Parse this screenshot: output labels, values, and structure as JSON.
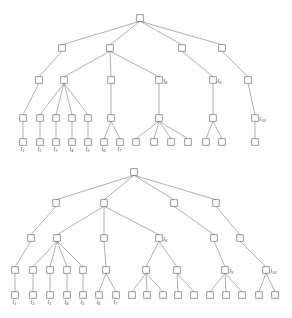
{
  "figure": {
    "type": "tree-diagram-pair",
    "width": 292,
    "height": 318,
    "background_color": "#ffffff",
    "node_fill": "#ffffff",
    "node_stroke": "#6e6e6e",
    "edge_stroke": "#7a7a7a",
    "label_color": "#3a3a3a",
    "node_size": 6.5
  },
  "trees": [
    {
      "name": "upper-tree",
      "id": "tree-top",
      "root": {
        "x": 140,
        "y": 18
      },
      "levels_y": [
        18,
        48,
        80,
        120,
        142
      ],
      "nodes": [
        {
          "id": "t0",
          "x": 140,
          "y": 18,
          "level": 0,
          "label": ""
        },
        {
          "id": "t1",
          "x": 62,
          "y": 48,
          "level": 1,
          "label": ""
        },
        {
          "id": "t2",
          "x": 110,
          "y": 48,
          "level": 1,
          "label": ""
        },
        {
          "id": "t3",
          "x": 182,
          "y": 48,
          "level": 1,
          "label": ""
        },
        {
          "id": "t4",
          "x": 222,
          "y": 48,
          "level": 1,
          "label": ""
        },
        {
          "id": "t5",
          "x": 39,
          "y": 80,
          "level": 2,
          "label": ""
        },
        {
          "id": "t6",
          "x": 64,
          "y": 80,
          "level": 2,
          "label": ""
        },
        {
          "id": "t7",
          "x": 111,
          "y": 80,
          "level": 2,
          "label": ""
        },
        {
          "id": "t8",
          "x": 159,
          "y": 80,
          "level": 2,
          "label": "l8"
        },
        {
          "id": "t9",
          "x": 213,
          "y": 80,
          "level": 2,
          "label": "l9"
        },
        {
          "id": "t10",
          "x": 248,
          "y": 80,
          "level": 2,
          "label": ""
        },
        {
          "id": "t11",
          "x": 23,
          "y": 118,
          "level": 3,
          "label": ""
        },
        {
          "id": "t12",
          "x": 40,
          "y": 118,
          "level": 3,
          "label": ""
        },
        {
          "id": "t13",
          "x": 56,
          "y": 118,
          "level": 3,
          "label": ""
        },
        {
          "id": "t14",
          "x": 72,
          "y": 118,
          "level": 3,
          "label": ""
        },
        {
          "id": "t15",
          "x": 88,
          "y": 118,
          "level": 3,
          "label": ""
        },
        {
          "id": "t16",
          "x": 111,
          "y": 118,
          "level": 3,
          "label": ""
        },
        {
          "id": "t17",
          "x": 159,
          "y": 118,
          "level": 3,
          "label": ""
        },
        {
          "id": "t18",
          "x": 213,
          "y": 118,
          "level": 3,
          "label": ""
        },
        {
          "id": "t19",
          "x": 255,
          "y": 118,
          "level": 3,
          "label": "l10"
        },
        {
          "id": "t20",
          "x": 23,
          "y": 142,
          "level": 4,
          "label": "l1"
        },
        {
          "id": "t21",
          "x": 40,
          "y": 142,
          "level": 4,
          "label": "l2"
        },
        {
          "id": "t22",
          "x": 56,
          "y": 142,
          "level": 4,
          "label": "l3"
        },
        {
          "id": "t23",
          "x": 72,
          "y": 142,
          "level": 4,
          "label": "l4"
        },
        {
          "id": "t24",
          "x": 88,
          "y": 142,
          "level": 4,
          "label": "l5"
        },
        {
          "id": "t25",
          "x": 104,
          "y": 142,
          "level": 4,
          "label": "l6"
        },
        {
          "id": "t26",
          "x": 120,
          "y": 142,
          "level": 4,
          "label": "l7"
        },
        {
          "id": "t27",
          "x": 136,
          "y": 142,
          "level": 4,
          "label": ""
        },
        {
          "id": "t28",
          "x": 154,
          "y": 142,
          "level": 4,
          "label": ""
        },
        {
          "id": "t29",
          "x": 171,
          "y": 142,
          "level": 4,
          "label": ""
        },
        {
          "id": "t30",
          "x": 188,
          "y": 142,
          "level": 4,
          "label": ""
        },
        {
          "id": "t31",
          "x": 206,
          "y": 142,
          "level": 4,
          "label": ""
        },
        {
          "id": "t32",
          "x": 222,
          "y": 142,
          "level": 4,
          "label": ""
        },
        {
          "id": "t33",
          "x": 255,
          "y": 142,
          "level": 4,
          "label": ""
        }
      ],
      "edges": [
        [
          "t0",
          "t1"
        ],
        [
          "t0",
          "t2"
        ],
        [
          "t0",
          "t3"
        ],
        [
          "t0",
          "t4"
        ],
        [
          "t1",
          "t5"
        ],
        [
          "t2",
          "t6"
        ],
        [
          "t2",
          "t7"
        ],
        [
          "t2",
          "t8"
        ],
        [
          "t3",
          "t9"
        ],
        [
          "t4",
          "t10"
        ],
        [
          "t5",
          "t11"
        ],
        [
          "t6",
          "t12"
        ],
        [
          "t6",
          "t13"
        ],
        [
          "t6",
          "t14"
        ],
        [
          "t6",
          "t15"
        ],
        [
          "t7",
          "t16"
        ],
        [
          "t8",
          "t17"
        ],
        [
          "t9",
          "t18"
        ],
        [
          "t10",
          "t19"
        ],
        [
          "t11",
          "t20"
        ],
        [
          "t12",
          "t21"
        ],
        [
          "t13",
          "t22"
        ],
        [
          "t14",
          "t23"
        ],
        [
          "t15",
          "t24"
        ],
        [
          "t16",
          "t25"
        ],
        [
          "t16",
          "t26"
        ],
        [
          "t17",
          "t27"
        ],
        [
          "t17",
          "t28"
        ],
        [
          "t17",
          "t29"
        ],
        [
          "t17",
          "t30"
        ],
        [
          "t18",
          "t31"
        ],
        [
          "t18",
          "t32"
        ],
        [
          "t19",
          "t33"
        ]
      ]
    },
    {
      "name": "lower-tree",
      "id": "tree-bottom",
      "root": {
        "x": 134,
        "y": 172
      },
      "levels_y": [
        172,
        203,
        238,
        270,
        295
      ],
      "nodes": [
        {
          "id": "b0",
          "x": 134,
          "y": 172,
          "level": 0,
          "label": ""
        },
        {
          "id": "b1",
          "x": 56,
          "y": 203,
          "level": 1,
          "label": ""
        },
        {
          "id": "b2",
          "x": 104,
          "y": 203,
          "level": 1,
          "label": ""
        },
        {
          "id": "b3",
          "x": 174,
          "y": 203,
          "level": 1,
          "label": ""
        },
        {
          "id": "b4",
          "x": 216,
          "y": 203,
          "level": 1,
          "label": ""
        },
        {
          "id": "b5",
          "x": 31,
          "y": 238,
          "level": 2,
          "label": ""
        },
        {
          "id": "b6",
          "x": 57,
          "y": 238,
          "level": 2,
          "label": ""
        },
        {
          "id": "b7",
          "x": 104,
          "y": 238,
          "level": 2,
          "label": ""
        },
        {
          "id": "b8",
          "x": 159,
          "y": 238,
          "level": 2,
          "label": "l8"
        },
        {
          "id": "b9",
          "x": 214,
          "y": 238,
          "level": 2,
          "label": ""
        },
        {
          "id": "b10",
          "x": 240,
          "y": 238,
          "level": 2,
          "label": ""
        },
        {
          "id": "b11",
          "x": 15,
          "y": 270,
          "level": 3,
          "label": ""
        },
        {
          "id": "b12",
          "x": 33,
          "y": 270,
          "level": 3,
          "label": ""
        },
        {
          "id": "b13",
          "x": 50,
          "y": 270,
          "level": 3,
          "label": ""
        },
        {
          "id": "b14",
          "x": 67,
          "y": 270,
          "level": 3,
          "label": ""
        },
        {
          "id": "b15",
          "x": 83,
          "y": 270,
          "level": 3,
          "label": ""
        },
        {
          "id": "b16",
          "x": 106,
          "y": 270,
          "level": 3,
          "label": ""
        },
        {
          "id": "b17",
          "x": 146,
          "y": 270,
          "level": 3,
          "label": ""
        },
        {
          "id": "b18",
          "x": 177,
          "y": 270,
          "level": 3,
          "label": ""
        },
        {
          "id": "b19",
          "x": 225,
          "y": 270,
          "level": 3,
          "label": "l9"
        },
        {
          "id": "b20",
          "x": 266,
          "y": 270,
          "level": 3,
          "label": "l10"
        },
        {
          "id": "b21",
          "x": 15,
          "y": 295,
          "level": 4,
          "label": "l1"
        },
        {
          "id": "b22",
          "x": 33,
          "y": 295,
          "level": 4,
          "label": "l2"
        },
        {
          "id": "b23",
          "x": 50,
          "y": 295,
          "level": 4,
          "label": "l3"
        },
        {
          "id": "b24",
          "x": 67,
          "y": 295,
          "level": 4,
          "label": "l4"
        },
        {
          "id": "b25",
          "x": 83,
          "y": 295,
          "level": 4,
          "label": "l5"
        },
        {
          "id": "b26",
          "x": 99,
          "y": 295,
          "level": 4,
          "label": "l6"
        },
        {
          "id": "b27",
          "x": 116,
          "y": 295,
          "level": 4,
          "label": "l7"
        },
        {
          "id": "b28",
          "x": 132,
          "y": 295,
          "level": 4,
          "label": ""
        },
        {
          "id": "b29",
          "x": 147,
          "y": 295,
          "level": 4,
          "label": ""
        },
        {
          "id": "b30",
          "x": 163,
          "y": 295,
          "level": 4,
          "label": ""
        },
        {
          "id": "b31",
          "x": 178,
          "y": 295,
          "level": 4,
          "label": ""
        },
        {
          "id": "b32",
          "x": 194,
          "y": 295,
          "level": 4,
          "label": ""
        },
        {
          "id": "b33",
          "x": 210,
          "y": 295,
          "level": 4,
          "label": ""
        },
        {
          "id": "b34",
          "x": 226,
          "y": 295,
          "level": 4,
          "label": ""
        },
        {
          "id": "b35",
          "x": 242,
          "y": 295,
          "level": 4,
          "label": ""
        },
        {
          "id": "b36",
          "x": 259,
          "y": 295,
          "level": 4,
          "label": ""
        },
        {
          "id": "b37",
          "x": 275,
          "y": 295,
          "level": 4,
          "label": ""
        }
      ],
      "edges": [
        [
          "b0",
          "b1"
        ],
        [
          "b0",
          "b2"
        ],
        [
          "b0",
          "b3"
        ],
        [
          "b0",
          "b4"
        ],
        [
          "b1",
          "b5"
        ],
        [
          "b2",
          "b6"
        ],
        [
          "b2",
          "b7"
        ],
        [
          "b2",
          "b8"
        ],
        [
          "b3",
          "b9"
        ],
        [
          "b4",
          "b10"
        ],
        [
          "b5",
          "b11"
        ],
        [
          "b6",
          "b12"
        ],
        [
          "b6",
          "b13"
        ],
        [
          "b6",
          "b14"
        ],
        [
          "b6",
          "b15"
        ],
        [
          "b7",
          "b16"
        ],
        [
          "b8",
          "b17"
        ],
        [
          "b8",
          "b18"
        ],
        [
          "b9",
          "b19"
        ],
        [
          "b10",
          "b20"
        ],
        [
          "b11",
          "b21"
        ],
        [
          "b12",
          "b22"
        ],
        [
          "b13",
          "b23"
        ],
        [
          "b14",
          "b24"
        ],
        [
          "b15",
          "b25"
        ],
        [
          "b16",
          "b26"
        ],
        [
          "b16",
          "b27"
        ],
        [
          "b17",
          "b28"
        ],
        [
          "b17",
          "b29"
        ],
        [
          "b17",
          "b30"
        ],
        [
          "b18",
          "b31"
        ],
        [
          "b18",
          "b32"
        ],
        [
          "b19",
          "b33"
        ],
        [
          "b19",
          "b34"
        ],
        [
          "b19",
          "b35"
        ],
        [
          "b20",
          "b36"
        ],
        [
          "b20",
          "b37"
        ]
      ]
    }
  ]
}
